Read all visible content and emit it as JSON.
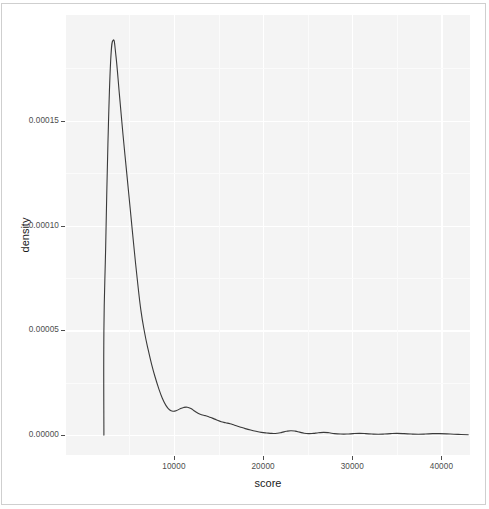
{
  "figure": {
    "background_color": "#ffffff",
    "panel_background_color": "#f4f4f4",
    "grid_color": "#ffffff",
    "line_color": "#3a3a3a",
    "axis_text_color": "#4d4d4d",
    "axis_title_color": "#1a1a1a"
  },
  "chart_data": {
    "type": "line",
    "subtype": "kernel-density-estimate",
    "title": "",
    "subtitle": "",
    "xlabel": "score",
    "ylabel": "density",
    "grid": true,
    "grid_major_x": [
      10000,
      20000,
      30000,
      40000
    ],
    "grid_major_y": [
      0.0,
      5e-05,
      0.0001,
      0.00015
    ],
    "legend_position": "none",
    "legend_entries": [],
    "annotations": [],
    "xlim": [
      -2100,
      43200
    ],
    "ylim": [
      -9.5e-06,
      0.0002005
    ],
    "xticks": [
      10000,
      20000,
      30000,
      40000
    ],
    "xticklabels": [
      "10000",
      "20000",
      "30000",
      "40000"
    ],
    "yticks": [
      0.0,
      5e-05,
      0.0001,
      0.00015
    ],
    "yticklabels": [
      "0.00000",
      "0.00005",
      "0.00010",
      "0.00015"
    ],
    "peak": {
      "x": 2250,
      "y": 0.0001885
    },
    "secondary_bump": {
      "x": 11500,
      "y": 1.33e-05
    },
    "series": [
      {
        "name": "density",
        "x": [
          2150,
          2150,
          2350,
          2600,
          2900,
          3200,
          3500,
          3900,
          4300,
          4700,
          5100,
          5500,
          5900,
          6300,
          6700,
          7100,
          7500,
          7900,
          8300,
          8700,
          9100,
          9500,
          9900,
          10300,
          10700,
          11100,
          11500,
          11900,
          12300,
          12700,
          13100,
          13500,
          13900,
          14300,
          14800,
          15300,
          15800,
          16300,
          16800,
          17400,
          18000,
          18600,
          19200,
          19800,
          20400,
          21000,
          21600,
          22100,
          22600,
          23100,
          23600,
          24100,
          24600,
          25100,
          25600,
          26200,
          26800,
          27400,
          28000,
          28700,
          29400,
          30100,
          30800,
          31500,
          32200,
          32900,
          33600,
          34300,
          35000,
          35800,
          36600,
          37400,
          38200,
          39000,
          39800,
          40600,
          41400,
          42200,
          43000
        ],
        "y": [
          0.0,
          5e-05,
          9e-05,
          0.000139,
          0.000178,
          0.0001885,
          0.000181,
          0.000162,
          0.000143,
          0.0001255,
          0.000108,
          9.05e-05,
          7.4e-05,
          5.95e-05,
          4.92e-05,
          4.1e-05,
          3.38e-05,
          2.76e-05,
          2.22e-05,
          1.76e-05,
          1.42e-05,
          1.21e-05,
          1.14e-05,
          1.17e-05,
          1.26e-05,
          1.32e-05,
          1.33e-05,
          1.27e-05,
          1.15e-05,
          1.04e-05,
          9.7e-06,
          9.3e-06,
          8.8e-06,
          8.1e-06,
          7.2e-06,
          6.4e-06,
          5.9e-06,
          5.4e-06,
          4.7e-06,
          3.9e-06,
          3.1e-06,
          2.4e-06,
          1.8e-06,
          1.3e-06,
          1e-06,
          8e-07,
          9e-07,
          1.3e-06,
          1.8e-06,
          2.1e-06,
          1.9e-06,
          1.4e-06,
          9e-07,
          7e-07,
          8e-07,
          1.1e-06,
          1.3e-06,
          1.1e-06,
          7e-07,
          5e-07,
          5e-07,
          7e-07,
          8e-07,
          7e-07,
          5e-07,
          4e-07,
          5e-07,
          7e-07,
          8e-07,
          7e-07,
          5e-07,
          4e-07,
          5e-07,
          7e-07,
          7e-07,
          6e-07,
          4e-07,
          3e-07,
          2e-07
        ]
      }
    ]
  }
}
